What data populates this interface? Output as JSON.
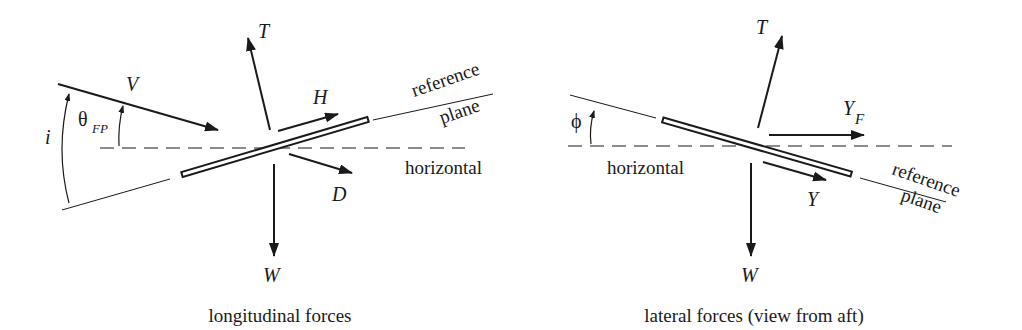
{
  "figure": {
    "colors": {
      "ink": "#1a1a1a",
      "background": "#ffffff"
    }
  },
  "longitudinal": {
    "caption": "longitudinal forces",
    "labels": {
      "V": "V",
      "T": "T",
      "H": "H",
      "D": "D",
      "W": "W",
      "theta": "θ",
      "theta_sub": "FP",
      "i": "i",
      "reference": "reference",
      "plane": "plane",
      "horizontal": "horizontal"
    }
  },
  "lateral": {
    "caption": "lateral forces (view from aft)",
    "labels": {
      "T": "T",
      "Y_F": "Y",
      "Y_F_sub": "F",
      "Y": "Y",
      "W": "W",
      "phi": "ϕ",
      "reference": "reference",
      "plane": "plane",
      "horizontal": "horizontal"
    }
  }
}
